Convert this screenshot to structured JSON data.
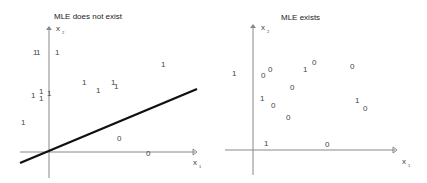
{
  "panels": [
    {
      "title": "MLE does not exist",
      "x_axis_label": "x",
      "x_axis_subscript": "1",
      "y_axis_label": "x",
      "y_axis_subscript": "2",
      "points": [
        {
          "label": "1",
          "x": 33,
          "y": 49
        },
        {
          "label": "1",
          "x": 36,
          "y": 49
        },
        {
          "label": "1",
          "x": 55,
          "y": 49
        },
        {
          "label": "1",
          "x": 82,
          "y": 79
        },
        {
          "label": "1",
          "x": 96,
          "y": 87
        },
        {
          "label": "1",
          "x": 111,
          "y": 79
        },
        {
          "label": "1",
          "x": 114,
          "y": 83
        },
        {
          "label": "1",
          "x": 161,
          "y": 61
        },
        {
          "label": "1",
          "x": 31,
          "y": 92
        },
        {
          "label": "1",
          "x": 39,
          "y": 88
        },
        {
          "label": "1",
          "x": 39,
          "y": 95
        },
        {
          "label": "1",
          "x": 47,
          "y": 90
        },
        {
          "label": "1",
          "x": 21,
          "y": 119
        },
        {
          "label": "0",
          "x": 117,
          "y": 135
        },
        {
          "label": "0",
          "x": 146,
          "y": 150
        }
      ],
      "separating_line": {
        "x1": 20,
        "y1": 163,
        "x2": 197,
        "y2": 89
      }
    },
    {
      "title": "MLE exists",
      "x_axis_label": "x",
      "x_axis_subscript": "1",
      "y_axis_label": "x",
      "y_axis_subscript": "2",
      "points": [
        {
          "label": "1",
          "x": 19,
          "y": 70
        },
        {
          "label": "0",
          "x": 48,
          "y": 72
        },
        {
          "label": "0",
          "x": 55,
          "y": 66
        },
        {
          "label": "1",
          "x": 90,
          "y": 66
        },
        {
          "label": "0",
          "x": 99,
          "y": 59
        },
        {
          "label": "0",
          "x": 137,
          "y": 63
        },
        {
          "label": "0",
          "x": 77,
          "y": 84
        },
        {
          "label": "1",
          "x": 47,
          "y": 95
        },
        {
          "label": "0",
          "x": 58,
          "y": 102
        },
        {
          "label": "0",
          "x": 73,
          "y": 114
        },
        {
          "label": "1",
          "x": 142,
          "y": 97
        },
        {
          "label": "0",
          "x": 150,
          "y": 105
        },
        {
          "label": "1",
          "x": 51,
          "y": 140
        },
        {
          "label": "0",
          "x": 112,
          "y": 141
        }
      ]
    }
  ]
}
